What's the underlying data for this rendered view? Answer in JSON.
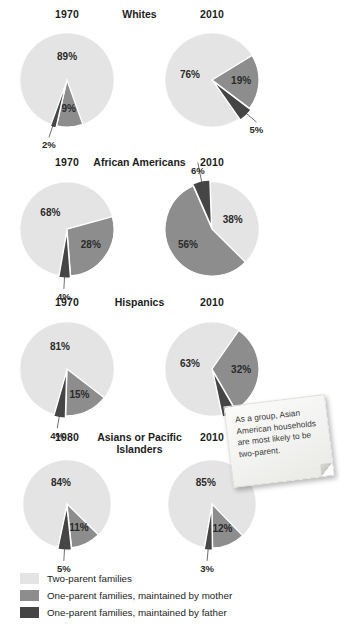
{
  "legend": {
    "items": [
      {
        "label": "Two-parent families",
        "key": "two_parent",
        "color": "#e4e4e4"
      },
      {
        "label": "One-parent families, maintained by mother",
        "key": "mother",
        "color": "#8d8d8d"
      },
      {
        "label": "One-parent families, maintained by father",
        "key": "father",
        "color": "#454545"
      }
    ]
  },
  "annotation": {
    "name": "sticky-note",
    "text": "As a group, Asian American households are most likely to be two-parent."
  },
  "chart_data": {
    "type": "pie",
    "title": "",
    "series_labels": [
      "Two-parent families",
      "One-parent families, maintained by mother",
      "One-parent families, maintained by father"
    ],
    "colors": {
      "two_parent": "#e4e4e4",
      "mother": "#8d8d8d",
      "father": "#454545"
    },
    "groups": [
      {
        "name": "Whites",
        "group_label": "Whites",
        "charts": [
          {
            "year": "1970",
            "values": {
              "two_parent": 89,
              "mother": 9,
              "father": 2
            },
            "labels": {
              "two_parent": "89%",
              "mother": "9%",
              "father": "2%"
            }
          },
          {
            "year": "2010",
            "values": {
              "two_parent": 76,
              "mother": 19,
              "father": 5
            },
            "labels": {
              "two_parent": "76%",
              "mother": "19%",
              "father": "5%"
            }
          }
        ]
      },
      {
        "name": "African Americans",
        "group_label": "African Americans",
        "charts": [
          {
            "year": "1970",
            "values": {
              "two_parent": 68,
              "mother": 28,
              "father": 4
            },
            "labels": {
              "two_parent": "68%",
              "mother": "28%",
              "father": "4%"
            }
          },
          {
            "year": "2010",
            "values": {
              "two_parent": 38,
              "mother": 56,
              "father": 6
            },
            "labels": {
              "two_parent": "38%",
              "mother": "56%",
              "father": "6%"
            }
          }
        ]
      },
      {
        "name": "Hispanics",
        "group_label": "Hispanics",
        "charts": [
          {
            "year": "1970",
            "values": {
              "two_parent": 81,
              "mother": 15,
              "father": 4
            },
            "labels": {
              "two_parent": "81%",
              "mother": "15%",
              "father": "4%"
            }
          },
          {
            "year": "2010",
            "values": {
              "two_parent": 63,
              "mother": 32,
              "father": 5
            },
            "labels": {
              "two_parent": "63%",
              "mother": "32%",
              "father": "5%"
            }
          }
        ]
      },
      {
        "name": "Asians or Pacific Islanders",
        "group_label": "Asians or Pacific Islanders",
        "charts": [
          {
            "year": "1980",
            "values": {
              "two_parent": 84,
              "mother": 11,
              "father": 5
            },
            "labels": {
              "two_parent": "84%",
              "mother": "11%",
              "father": "5%"
            }
          },
          {
            "year": "2010",
            "values": {
              "two_parent": 85,
              "mother": 12,
              "father": 3
            },
            "labels": {
              "two_parent": "85%",
              "mother": "12%",
              "father": "3%"
            }
          }
        ]
      }
    ]
  }
}
